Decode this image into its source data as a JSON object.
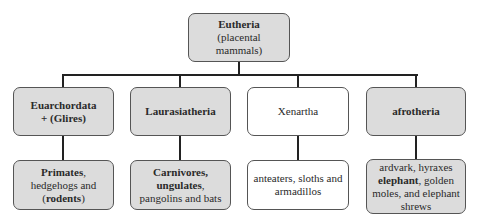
{
  "diagram": {
    "type": "tree",
    "colors": {
      "filled_box": "#dcdcdc",
      "plain_box": "#ffffff",
      "border": "#555555",
      "connector": "#222222"
    },
    "root": {
      "title": "Eutheria",
      "subtitle": "(placental mammals)"
    },
    "groups": [
      {
        "name_line1": "Euarchordata",
        "name_line2": "+ (Glires)",
        "leaf": {
          "line1_bold": "Primates",
          "line1_rest": ",",
          "line2": "hedgehogs and",
          "line3_pre": "(",
          "line3_bold": "rodents",
          "line3_post": ")"
        }
      },
      {
        "name": "Laurasiatheria",
        "leaf": {
          "line1_bold": "Carnivores,",
          "line2_bold": "ungulates",
          "line2_rest": ",",
          "line3": "pangolins and bats"
        }
      },
      {
        "name": "Xenartha",
        "leaf": {
          "line1": "anteaters, sloths and",
          "line2": "armadillos"
        }
      },
      {
        "name": "afrotheria",
        "leaf": {
          "line1": "ardvark, hyraxes",
          "line2_bold": "elephant",
          "line2_rest": ", golden",
          "line3": "moles, and elephant",
          "line4": "shrews"
        }
      }
    ]
  }
}
